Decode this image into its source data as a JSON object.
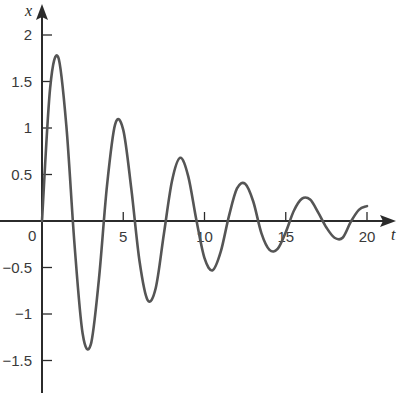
{
  "chart_data": {
    "type": "line",
    "title": "",
    "xlabel": "t",
    "ylabel": "x",
    "xlim": [
      0,
      20
    ],
    "ylim": [
      -1.5,
      2
    ],
    "grid": false,
    "legend": null,
    "x_ticks": [
      0,
      5,
      10,
      15,
      20
    ],
    "x_tick_labels": [
      "0",
      "5",
      "10",
      "15",
      "20"
    ],
    "y_ticks": [
      2,
      1.5,
      1,
      0.5,
      -0.5,
      -1,
      -1.5
    ],
    "y_tick_labels": [
      "2",
      "1.5",
      "1",
      "0.5",
      "−0.5",
      "−1",
      "−1.5"
    ],
    "series": [
      {
        "name": "x(t)",
        "color": "#555555",
        "x": [
          0,
          0.5,
          1,
          1.5,
          2,
          2.5,
          3,
          3.5,
          4,
          4.5,
          5,
          5.5,
          6,
          6.5,
          7,
          7.5,
          8,
          8.5,
          9,
          9.5,
          10,
          10.5,
          11,
          11.5,
          12,
          12.5,
          13,
          13.5,
          14,
          14.5,
          15,
          15.5,
          16,
          16.5,
          17,
          17.5,
          18,
          18.5,
          19,
          19.5,
          20
        ],
        "values": [
          0,
          1.43,
          1.76,
          1.02,
          -0.25,
          -1.21,
          -1.33,
          -0.63,
          0.38,
          1.04,
          0.98,
          0.34,
          -0.43,
          -0.85,
          -0.72,
          -0.14,
          0.43,
          0.68,
          0.48,
          0.01,
          -0.4,
          -0.53,
          -0.33,
          0.05,
          0.35,
          0.4,
          0.21,
          -0.13,
          -0.31,
          -0.3,
          -0.12,
          0.11,
          0.24,
          0.23,
          0.09,
          -0.07,
          -0.18,
          -0.18,
          -0.01,
          0.12,
          0.16
        ]
      }
    ],
    "annotations": {
      "peaks": [
        {
          "t": 1.1,
          "x": 1.76
        },
        {
          "t": 3.1,
          "x": -1.31
        },
        {
          "t": 5.0,
          "x": 1.0
        },
        {
          "t": 7.0,
          "x": -0.77
        },
        {
          "t": 8.9,
          "x": 0.61
        },
        {
          "t": 10.8,
          "x": -0.47
        },
        {
          "t": 12.7,
          "x": 0.39
        },
        {
          "t": 14.5,
          "x": -0.3
        },
        {
          "t": 16.4,
          "x": 0.25
        },
        {
          "t": 18.3,
          "x": -0.18
        }
      ]
    }
  },
  "axes": {
    "x_label": "t",
    "y_label": "x",
    "origin_label": "0"
  },
  "colors": {
    "axis": "#2b2b2b",
    "curve": "#555555",
    "text": "#3a3a3a",
    "background": "#ffffff"
  }
}
